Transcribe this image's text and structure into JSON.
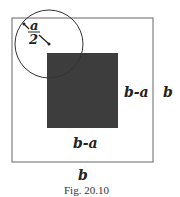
{
  "figure": {
    "caption": "Fig. 20.10",
    "labels": {
      "radius_num": "a",
      "radius_den": "2",
      "inner_right": "b-a",
      "inner_bottom": "b-a",
      "outer_right": "b",
      "outer_bottom": "b"
    },
    "colors": {
      "outline": "#555555",
      "inner_square": "#3d3d3d",
      "text": "#222222"
    }
  }
}
